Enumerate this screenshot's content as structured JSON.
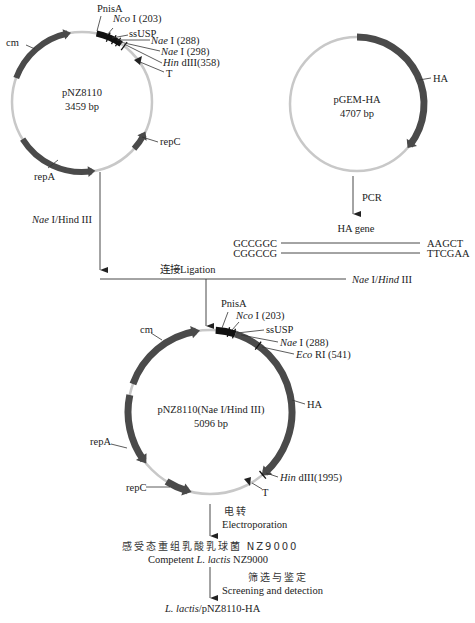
{
  "plasmid_pnz8110": {
    "name": "pNZ8110",
    "size": "3459 bp",
    "features": {
      "cm": "cm",
      "pnisa": "PnisA",
      "ncoi_italic": "Nco",
      "ncoi_rest": " I (203)",
      "ssusp": "ssUSP",
      "naei1_italic": "Nae",
      "naei1_rest": " I (288)",
      "naei2_italic": "Nae",
      "naei2_rest": " I (298)",
      "hind_italic": "Hin",
      "hind_rest": " dIII(358)",
      "t": "T",
      "repc": "repC",
      "repa": "repA"
    }
  },
  "plasmid_pgem": {
    "name": "pGEM-HA",
    "size": "4707 bp",
    "features": {
      "ha": "HA"
    }
  },
  "steps": {
    "digest_left_italic": "Nae",
    "digest_left_rest": " I/Hind III",
    "pcr": "PCR",
    "ha_gene": "HA gene",
    "seq_top_left": "GCCGGC",
    "seq_top_right": "AAGCT",
    "seq_bot_left": "CGGCCG",
    "seq_bot_right": "TTCGAA",
    "ligation": "连接Ligation",
    "digest_right_italic1": "Nae",
    "digest_right_mid": " I/",
    "digest_right_italic2": "Hind",
    "digest_right_rest": " III",
    "electro_cn": "电转",
    "electro_en": "Electroporation",
    "competent_cn": "感受态重组乳酸乳球菌 NZ9000",
    "competent_en_pre": "Competent ",
    "competent_en_italic": "L. lactis",
    "competent_en_post": " NZ9000",
    "screen_cn": "筛选与鉴定",
    "screen_en": "Screening and detection",
    "final_italic": "L. lactis",
    "final_rest": "/pNZ8110-HA"
  },
  "plasmid_recomb": {
    "name": "pNZ8110(Nae I/Hind III)",
    "size": "5096 bp",
    "features": {
      "cm": "cm",
      "pnisa": "PnisA",
      "ncoi_italic": "Nco",
      "ncoi_rest": " I (203)",
      "ssusp": "ssUSP",
      "naei_italic": "Nae",
      "naei_rest": " I (288)",
      "ecori_italic": "Eco",
      "ecori_rest": " RI (541)",
      "ha": "HA",
      "hind_italic": "Hin",
      "hind_rest": " dIII(1995)",
      "t": "T",
      "repc": "repC",
      "repa": "repA"
    }
  },
  "colors": {
    "backbone": "#c8c8c8",
    "gene": "#4a4a4a",
    "promoter": "#111111",
    "line": "#333333"
  }
}
